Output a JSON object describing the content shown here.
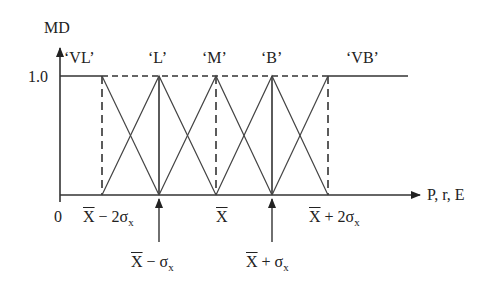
{
  "diagram": {
    "type": "fuzzy-membership-functions",
    "y_axis": {
      "label": "MD",
      "tick_label": "1.0"
    },
    "x_axis": {
      "label": "P, r, E",
      "origin_label": "0"
    },
    "sets": [
      {
        "name": "'VL'",
        "label": "‘VL’",
        "shape": "left-shoulder",
        "flat_to": "X̄ − 2σx",
        "zero_at": "X̄ − σx"
      },
      {
        "name": "'L'",
        "label": "‘L’",
        "shape": "triangle",
        "peak": "X̄ − σx",
        "support": [
          "X̄ − 2σx",
          "X̄"
        ]
      },
      {
        "name": "'M'",
        "label": "‘M’",
        "shape": "triangle",
        "peak": "X̄",
        "support": [
          "X̄ − σx",
          "X̄ + σx"
        ]
      },
      {
        "name": "'B'",
        "label": "‘B’",
        "shape": "triangle",
        "peak": "X̄ + σx",
        "support": [
          "X̄",
          "X̄ + 2σx"
        ]
      },
      {
        "name": "'VB'",
        "label": "‘VB’",
        "shape": "right-shoulder",
        "flat_from": "X̄ + 2σx",
        "zero_at": "X̄ + σx"
      }
    ],
    "tick_labels": {
      "m2": {
        "x": "X",
        "rest": " − 2σ",
        "sub": "x"
      },
      "m1": {
        "x": "X",
        "rest": " − σ",
        "sub": "x"
      },
      "mean": {
        "x": "X",
        "rest": "",
        "sub": ""
      },
      "p1": {
        "x": "X",
        "rest": " + σ",
        "sub": "x"
      },
      "p2": {
        "x": "X",
        "rest": " + 2σ",
        "sub": "x"
      }
    }
  }
}
